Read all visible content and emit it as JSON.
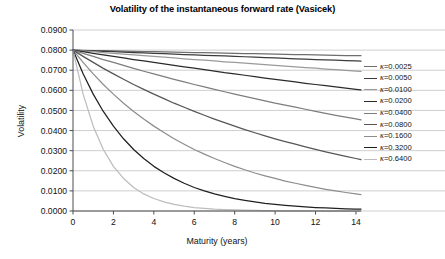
{
  "chart_data": {
    "type": "line",
    "title": "Volatility of the instantaneous forward rate (Vasicek)",
    "xlabel": "Maturity (years)",
    "ylabel": "Volatility",
    "xlim": [
      0,
      14.25
    ],
    "ylim": [
      0.0,
      0.09
    ],
    "grid": true,
    "legend_position": "right",
    "x_ticks": [
      0,
      2,
      4,
      6,
      8,
      10,
      12,
      14
    ],
    "x_tick_labels": [
      "0",
      "2",
      "4",
      "6",
      "8",
      "10",
      "12",
      "14"
    ],
    "y_ticks": [
      0.0,
      0.01,
      0.02,
      0.03,
      0.04,
      0.05,
      0.06,
      0.07,
      0.08,
      0.09
    ],
    "y_tick_labels": [
      "0.0000",
      "0.0100",
      "0.0200",
      "0.0300",
      "0.0400",
      "0.0500",
      "0.0600",
      "0.0700",
      "0.0800",
      "0.0900"
    ],
    "sigma": 0.08,
    "formula": "sigma * exp(-kappa * t)",
    "x": [
      0,
      0.5,
      1,
      1.5,
      2,
      2.5,
      3,
      3.5,
      4,
      4.5,
      5,
      5.5,
      6,
      6.5,
      7,
      7.5,
      8,
      8.5,
      9,
      9.5,
      10,
      10.5,
      11,
      11.5,
      12,
      12.5,
      13,
      13.5,
      14,
      14.25
    ],
    "series": [
      {
        "name": "κ=0.0025",
        "kappa": 0.0025,
        "color": "#6e6e6e",
        "values": [
          0.08,
          0.0799,
          0.0798,
          0.0797,
          0.0796,
          0.0795,
          0.0794,
          0.0793,
          0.0792,
          0.0791,
          0.079,
          0.0789,
          0.0788,
          0.0787,
          0.0786,
          0.0785,
          0.0784,
          0.0783,
          0.0782,
          0.0781,
          0.078,
          0.0779,
          0.0778,
          0.0777,
          0.0776,
          0.0775,
          0.0774,
          0.0773,
          0.0772,
          0.0772
        ]
      },
      {
        "name": "κ=0.0050",
        "kappa": 0.005,
        "color": "#3c3c3c",
        "values": [
          0.08,
          0.0798,
          0.0796,
          0.0794,
          0.0792,
          0.079,
          0.0788,
          0.0786,
          0.0784,
          0.0782,
          0.078,
          0.0778,
          0.0776,
          0.0774,
          0.0772,
          0.0771,
          0.0769,
          0.0767,
          0.0765,
          0.0763,
          0.0761,
          0.0759,
          0.0757,
          0.0755,
          0.0753,
          0.0751,
          0.075,
          0.0748,
          0.0746,
          0.0745
        ]
      },
      {
        "name": "κ=0.0100",
        "kappa": 0.01,
        "color": "#9a9a9a",
        "values": [
          0.08,
          0.0796,
          0.0792,
          0.0788,
          0.0784,
          0.078,
          0.0776,
          0.0772,
          0.0769,
          0.0765,
          0.0761,
          0.0757,
          0.0753,
          0.075,
          0.0746,
          0.0742,
          0.0739,
          0.0735,
          0.0731,
          0.0728,
          0.0724,
          0.072,
          0.0717,
          0.0713,
          0.071,
          0.0706,
          0.0703,
          0.0699,
          0.0696,
          0.0694
        ]
      },
      {
        "name": "κ=0.0200",
        "kappa": 0.02,
        "color": "#2a2a2a",
        "values": [
          0.08,
          0.0792,
          0.0784,
          0.0776,
          0.0769,
          0.0761,
          0.0753,
          0.0746,
          0.0739,
          0.0731,
          0.0724,
          0.0717,
          0.071,
          0.0703,
          0.0696,
          0.0688,
          0.0682,
          0.0675,
          0.0668,
          0.0661,
          0.0655,
          0.0648,
          0.0642,
          0.0635,
          0.0629,
          0.0623,
          0.0617,
          0.0611,
          0.0605,
          0.0602
        ]
      },
      {
        "name": "κ=0.0400",
        "kappa": 0.04,
        "color": "#7d7d7d",
        "values": [
          0.08,
          0.0784,
          0.0769,
          0.0753,
          0.0739,
          0.0724,
          0.0709,
          0.0695,
          0.0682,
          0.0668,
          0.0655,
          0.0642,
          0.0629,
          0.0617,
          0.0605,
          0.0593,
          0.0581,
          0.057,
          0.0559,
          0.0548,
          0.0536,
          0.0526,
          0.0516,
          0.0506,
          0.0495,
          0.0486,
          0.0476,
          0.0467,
          0.0458,
          0.0453
        ]
      },
      {
        "name": "κ=0.0800",
        "kappa": 0.08,
        "color": "#565656",
        "values": [
          0.08,
          0.0769,
          0.0739,
          0.0709,
          0.0682,
          0.0655,
          0.0629,
          0.0605,
          0.0581,
          0.0559,
          0.0536,
          0.0516,
          0.0495,
          0.0476,
          0.0457,
          0.0439,
          0.0422,
          0.0405,
          0.0389,
          0.0374,
          0.0359,
          0.0345,
          0.0332,
          0.0319,
          0.0306,
          0.0294,
          0.0283,
          0.0272,
          0.0261,
          0.0256
        ]
      },
      {
        "name": "κ=0.1600",
        "kappa": 0.16,
        "color": "#8d8d8d",
        "values": [
          0.08,
          0.0739,
          0.0682,
          0.0629,
          0.0581,
          0.0536,
          0.0495,
          0.0457,
          0.0422,
          0.039,
          0.0359,
          0.0332,
          0.0306,
          0.0283,
          0.0261,
          0.0241,
          0.0222,
          0.0205,
          0.0189,
          0.0175,
          0.0162,
          0.0149,
          0.0138,
          0.0127,
          0.0117,
          0.0108,
          0.01,
          0.0092,
          0.0085,
          0.0082
        ]
      },
      {
        "name": "κ=0.3200",
        "kappa": 0.32,
        "color": "#202020",
        "values": [
          0.08,
          0.0682,
          0.0581,
          0.0495,
          0.0422,
          0.0359,
          0.0306,
          0.0261,
          0.0222,
          0.019,
          0.0162,
          0.0138,
          0.0117,
          0.01,
          0.0085,
          0.0073,
          0.0062,
          0.0053,
          0.0045,
          0.0038,
          0.0033,
          0.0028,
          0.0024,
          0.002,
          0.0017,
          0.0015,
          0.0013,
          0.0011,
          0.0009,
          0.0009
        ]
      },
      {
        "name": "κ=0.6400",
        "kappa": 0.64,
        "color": "#bdbdbd",
        "values": [
          0.08,
          0.0581,
          0.0422,
          0.0306,
          0.0222,
          0.0162,
          0.0117,
          0.0085,
          0.0062,
          0.0045,
          0.0033,
          0.0024,
          0.0017,
          0.0013,
          0.0009,
          0.0007,
          0.0005,
          0.0004,
          0.0003,
          0.0002,
          0.0001,
          0.0001,
          0.0001,
          0.0001,
          0.0,
          0.0,
          0.0,
          0.0,
          0.0,
          0.0
        ]
      }
    ]
  },
  "legend": {
    "items": [
      {
        "label": "=0.0025",
        "symbol": "κ"
      },
      {
        "label": "=0.0050",
        "symbol": "κ"
      },
      {
        "label": "=0.0100",
        "symbol": "κ"
      },
      {
        "label": "=0.0200",
        "symbol": "κ"
      },
      {
        "label": "=0.0400",
        "symbol": "κ"
      },
      {
        "label": "=0.0800",
        "symbol": "κ"
      },
      {
        "label": "=0.1600",
        "symbol": "κ"
      },
      {
        "label": "=0.3200",
        "symbol": "κ"
      },
      {
        "label": "=0.6400",
        "symbol": "κ"
      }
    ]
  },
  "colors": {
    "grid": "#c9c9c9",
    "axis": "#4d4d4d",
    "background": "#ffffff",
    "text": "#111111"
  }
}
